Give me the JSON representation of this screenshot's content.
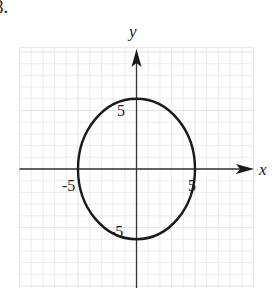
{
  "problem": {
    "number": "8."
  },
  "chart_data": {
    "type": "line",
    "title": "",
    "xlabel": "x",
    "ylabel": "y",
    "xlim": [
      -10,
      10
    ],
    "ylim": [
      -10,
      10.4
    ],
    "grid": true,
    "tick_labels": {
      "x": [
        {
          "value": -5,
          "label": "-5"
        },
        {
          "value": 5,
          "label": "5"
        }
      ],
      "y": [
        {
          "value": 5,
          "label": "5"
        },
        {
          "value": -5,
          "label": "-5"
        }
      ]
    },
    "series": [
      {
        "name": "ellipse",
        "shape": "ellipse",
        "equation": "x^2/25 + y^2/36 = 1",
        "center": [
          0,
          0
        ],
        "semi_axis_x": 5,
        "semi_axis_y": 6,
        "intercepts": {
          "x": [
            -5,
            5
          ],
          "y": [
            6,
            -6
          ]
        }
      }
    ]
  },
  "colors": {
    "curve": "#1a1a1a",
    "axes": "#333333",
    "grid": "#e4e4e4"
  }
}
